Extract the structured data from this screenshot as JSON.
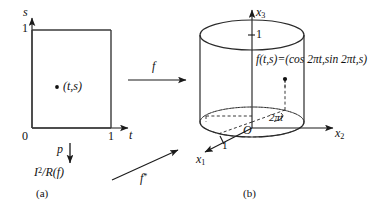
{
  "figure": {
    "panels": [
      {
        "tag": "(a)",
        "name": "unit-square-panel"
      },
      {
        "tag": "(b)",
        "name": "cylinder-panel"
      }
    ],
    "arrows": [
      {
        "label": "f",
        "name": "map-f-arrow",
        "direction": "right"
      },
      {
        "label": "p",
        "name": "quotient-p-arrow",
        "direction": "down"
      },
      {
        "label": "f*",
        "name": "induced-map-f-star-arrow",
        "direction": "up-right"
      }
    ]
  },
  "square": {
    "x_axis_label": "t",
    "y_axis_label": "s",
    "origin_label": "0",
    "x_tick_label": "1",
    "y_tick_label": "1",
    "point_label": "(t,s)",
    "quotient_label_base": "I",
    "quotient_label_exponent": "2",
    "quotient_label_rest": "/R(f)"
  },
  "cylinder": {
    "axis_x1_label": "x",
    "axis_x1_sub": "1",
    "axis_x2_label": "x",
    "axis_x2_sub": "2",
    "axis_x3_label": "x",
    "axis_x3_sub": "3",
    "origin_label": "O",
    "height_tick_label": "1",
    "radius_tick_label": "1",
    "angle_label": "2πt",
    "formula": "f(t,s)=(cos 2πt,sin 2πt,s)"
  },
  "colors": {
    "ink": "#1a1a1a",
    "line": "#222222",
    "background": "#ffffff"
  }
}
